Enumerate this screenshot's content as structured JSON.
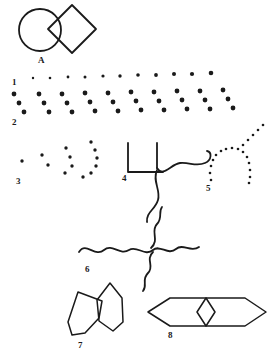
{
  "figure": {
    "background_color": "#ffffff",
    "ink_color": "#1a1a1a",
    "width": 273,
    "height": 356
  },
  "labels": {
    "a": "A",
    "one": "1",
    "two": "2",
    "three": "3",
    "four": "4",
    "five": "5",
    "six": "6",
    "seven": "7",
    "eight": "8"
  },
  "panels": [
    {
      "id": "A",
      "label": "A",
      "label_x": 38,
      "label_y": 56,
      "kind": "outline-shapes",
      "shapes": [
        "circle",
        "diamond"
      ],
      "stroke_width": 1.8,
      "circle": {
        "cx": 40,
        "cy": 30,
        "r": 21
      },
      "diamond": {
        "cx": 72,
        "cy": 29,
        "rx": 24,
        "ry": 24
      }
    },
    {
      "id": "1",
      "label": "1",
      "label_x": 12,
      "label_y": 84,
      "kind": "dot-row",
      "note": "Single row of small round dots increasing slightly in size from left to right",
      "dots": [
        {
          "cx": 33,
          "cy": 78,
          "r": 1.2
        },
        {
          "cx": 50,
          "cy": 78,
          "r": 1.3
        },
        {
          "cx": 68,
          "cy": 77,
          "r": 1.4
        },
        {
          "cx": 85,
          "cy": 77,
          "r": 1.5
        },
        {
          "cx": 103,
          "cy": 76,
          "r": 1.6
        },
        {
          "cx": 120,
          "cy": 76,
          "r": 1.7
        },
        {
          "cx": 138,
          "cy": 75,
          "r": 1.8
        },
        {
          "cx": 156,
          "cy": 75,
          "r": 1.9
        },
        {
          "cx": 174,
          "cy": 74,
          "r": 2.0
        },
        {
          "cx": 192,
          "cy": 74,
          "r": 2.1
        },
        {
          "cx": 211,
          "cy": 73,
          "r": 2.3
        }
      ]
    },
    {
      "id": "2",
      "label": "2",
      "label_x": 12,
      "label_y": 124,
      "kind": "dot-triplet-row",
      "note": "Ten groups of three dots arranged on a downward-right diagonal",
      "groups": [
        {
          "x": 14,
          "y": 94
        },
        {
          "x": 39,
          "y": 94
        },
        {
          "x": 62,
          "y": 94
        },
        {
          "x": 85,
          "y": 93
        },
        {
          "x": 108,
          "y": 93
        },
        {
          "x": 131,
          "y": 92
        },
        {
          "x": 154,
          "y": 92
        },
        {
          "x": 177,
          "y": 91
        },
        {
          "x": 200,
          "y": 91
        },
        {
          "x": 223,
          "y": 90
        }
      ],
      "offsets": [
        {
          "dx": 0,
          "dy": 0
        },
        {
          "dx": 5,
          "dy": 9
        },
        {
          "dx": 10,
          "dy": 18
        }
      ],
      "dot_radius": 2.4
    },
    {
      "id": "3",
      "label": "3",
      "label_x": 16,
      "label_y": 183,
      "kind": "dot-arc-progression",
      "note": "Four dotted clusters of increasing count forming progressively longer arcs",
      "clusters": [
        {
          "dots": [
            {
              "cx": 22,
              "cy": 161,
              "r": 1.7
            }
          ]
        },
        {
          "dots": [
            {
              "cx": 42,
              "cy": 155,
              "r": 1.7
            },
            {
              "cx": 48,
              "cy": 165,
              "r": 1.7
            }
          ]
        },
        {
          "dots": [
            {
              "cx": 66,
              "cy": 148,
              "r": 1.7
            },
            {
              "cx": 70,
              "cy": 157,
              "r": 1.7
            },
            {
              "cx": 72,
              "cy": 166,
              "r": 1.7
            },
            {
              "cx": 65,
              "cy": 173,
              "r": 1.7
            }
          ]
        },
        {
          "dots": [
            {
              "cx": 91,
              "cy": 142,
              "r": 1.7
            },
            {
              "cx": 95,
              "cy": 150,
              "r": 1.7
            },
            {
              "cx": 97,
              "cy": 158,
              "r": 1.7
            },
            {
              "cx": 96,
              "cy": 166,
              "r": 1.7
            },
            {
              "cx": 91,
              "cy": 173,
              "r": 1.7
            },
            {
              "cx": 83,
              "cy": 177,
              "r": 1.7
            }
          ]
        }
      ]
    },
    {
      "id": "4",
      "label": "4",
      "label_x": 122,
      "label_y": 180,
      "kind": "bracket-and-wave",
      "stroke_width": 1.8,
      "paths": [
        "M128 143 L128 172 L163 172",
        "M157 143 L157 168",
        "M157 168 C163 178 171 164 180 163 C190 162 196 167 205 163 C212 160 212 152 207 151",
        "M157 170 C152 181 161 190 158 200 C155 210 146 212 147 222"
      ]
    },
    {
      "id": "5",
      "label": "5",
      "label_x": 206,
      "label_y": 190,
      "kind": "dotted-arc-with-tail",
      "note": "Dotted inverted-U arc with a dotted diagonal ray rising to the upper right",
      "dots": [
        {
          "cx": 211,
          "cy": 180,
          "r": 1.3
        },
        {
          "cx": 210,
          "cy": 173,
          "r": 1.3
        },
        {
          "cx": 211,
          "cy": 166,
          "r": 1.3
        },
        {
          "cx": 213,
          "cy": 160,
          "r": 1.3
        },
        {
          "cx": 216,
          "cy": 155,
          "r": 1.3
        },
        {
          "cx": 221,
          "cy": 151,
          "r": 1.3
        },
        {
          "cx": 226,
          "cy": 149,
          "r": 1.3
        },
        {
          "cx": 232,
          "cy": 148,
          "r": 1.3
        },
        {
          "cx": 238,
          "cy": 149,
          "r": 1.3
        },
        {
          "cx": 243,
          "cy": 152,
          "r": 1.3
        },
        {
          "cx": 247,
          "cy": 157,
          "r": 1.3
        },
        {
          "cx": 249,
          "cy": 163,
          "r": 1.3
        },
        {
          "cx": 250,
          "cy": 170,
          "r": 1.3
        },
        {
          "cx": 250,
          "cy": 177,
          "r": 1.3
        },
        {
          "cx": 249,
          "cy": 183,
          "r": 1.3
        },
        {
          "cx": 243,
          "cy": 145,
          "r": 1.3
        },
        {
          "cx": 248,
          "cy": 140,
          "r": 1.3
        },
        {
          "cx": 253,
          "cy": 135,
          "r": 1.3
        },
        {
          "cx": 258,
          "cy": 130,
          "r": 1.3
        },
        {
          "cx": 263,
          "cy": 125,
          "r": 1.3
        }
      ]
    },
    {
      "id": "6",
      "label": "6",
      "label_x": 85,
      "label_y": 271,
      "kind": "crossing-waves",
      "stroke_width": 1.8,
      "paths": [
        "M79 252 C86 241 95 258 104 250 C112 243 120 256 129 250 C137 245 145 257 153 250 C160 244 168 256 176 249 C183 243 191 253 199 247",
        "M151 248 C160 240 150 231 157 224 C163 218 158 212 162 207",
        "M153 252 C145 260 155 266 148 273 C141 280 148 285 143 291"
      ]
    },
    {
      "id": "7",
      "label": "7",
      "label_x": 78,
      "label_y": 347,
      "kind": "overlapping-polygons",
      "stroke_width": 1.5,
      "paths": [
        "M78 292 L102 301 L99 318 L85 333 L72 335 L68 322 Z",
        "M110 283 L122 298 L123 322 L113 331 L99 321 L97 300 Z"
      ]
    },
    {
      "id": "8",
      "label": "8",
      "label_x": 168,
      "label_y": 337,
      "kind": "hexagon-with-inner-diamond",
      "stroke_width": 1.5,
      "paths": [
        "M148 312 L170 298 L245 298 L266 312 L245 326 L170 326 Z",
        "M206 298 L215 312 L206 326 L197 312 Z"
      ]
    }
  ]
}
